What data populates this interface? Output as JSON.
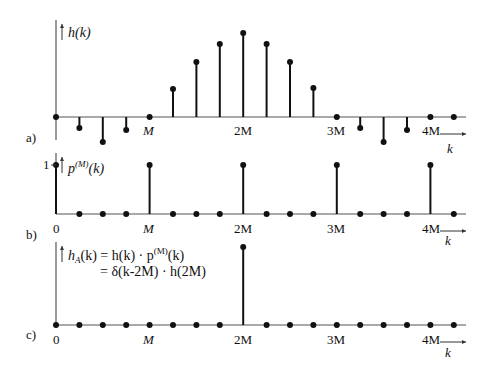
{
  "figure": {
    "panels": [
      {
        "id": "a",
        "tag": "a)",
        "ylabel": "h(k)",
        "axis_y": 117,
        "x_ticks": [
          {
            "label": "M",
            "x": 149
          },
          {
            "label": "2M",
            "x": 243
          },
          {
            "label": "3M",
            "x": 336
          },
          {
            "label": "4M",
            "x": 430
          }
        ],
        "xlabel": "k"
      },
      {
        "id": "b",
        "tag": "b)",
        "ylabel": "p(M)(k)",
        "ylabel_base": "p",
        "ylabel_sup": "(M)",
        "ylabel_arg": "(k)",
        "y_tick": "1",
        "axis_y": 214,
        "x_ticks": [
          {
            "label": "0",
            "x": 56
          },
          {
            "label": "M",
            "x": 149
          },
          {
            "label": "2M",
            "x": 243
          },
          {
            "label": "3M",
            "x": 336
          },
          {
            "label": "4M",
            "x": 430
          }
        ],
        "xlabel": "k"
      },
      {
        "id": "c",
        "tag": "c)",
        "formula_line1_lhs": "h",
        "formula_line1_sub": "A",
        "formula_line1_rest": "(k) = h(k) · p",
        "formula_line1_sup": "(M)",
        "formula_line1_end": "(k)",
        "formula_line2": "= δ(k-2M) · h(2M)",
        "axis_y": 325,
        "x_ticks": [
          {
            "label": "0",
            "x": 56
          },
          {
            "label": "M",
            "x": 149
          },
          {
            "label": "2M",
            "x": 243
          },
          {
            "label": "3M",
            "x": 336
          },
          {
            "label": "4M",
            "x": 430
          }
        ],
        "xlabel": "k"
      }
    ]
  },
  "chart_data": [
    {
      "type": "stem",
      "title": "a) h(k)",
      "xlabel": "k",
      "ylabel": "h(k)",
      "x_tick_labels": [
        "M",
        "2M",
        "3M",
        "4M"
      ],
      "note": "M = 4 samples per period; values in relative units (peak = 1 at k=2M)",
      "x": [
        0,
        1,
        2,
        3,
        4,
        5,
        6,
        7,
        8,
        9,
        10,
        11,
        12,
        13,
        14,
        15,
        16,
        17
      ],
      "values": [
        0,
        -0.13,
        -0.3,
        -0.15,
        0,
        0.33,
        0.66,
        0.88,
        1.0,
        0.88,
        0.66,
        0.34,
        0,
        -0.13,
        -0.3,
        -0.15,
        0,
        0
      ]
    },
    {
      "type": "stem",
      "title": "b) p(M)(k)",
      "xlabel": "k",
      "ylabel": "p(M)(k)",
      "x_tick_labels": [
        "0",
        "M",
        "2M",
        "3M",
        "4M"
      ],
      "y_tick_labels": [
        "1"
      ],
      "x": [
        0,
        1,
        2,
        3,
        4,
        5,
        6,
        7,
        8,
        9,
        10,
        11,
        12,
        13,
        14,
        15,
        16,
        17
      ],
      "values": [
        1,
        0,
        0,
        0,
        1,
        0,
        0,
        0,
        1,
        0,
        0,
        0,
        1,
        0,
        0,
        0,
        1,
        0
      ]
    },
    {
      "type": "stem",
      "title": "c) hA(k) = h(k)·p(M)(k) = δ(k-2M)·h(2M)",
      "xlabel": "k",
      "ylabel": "hA(k)",
      "x_tick_labels": [
        "0",
        "M",
        "2M",
        "3M",
        "4M"
      ],
      "x": [
        0,
        1,
        2,
        3,
        4,
        5,
        6,
        7,
        8,
        9,
        10,
        11,
        12,
        13,
        14,
        15,
        16,
        17
      ],
      "values": [
        0,
        0,
        0,
        0,
        0,
        0,
        0,
        0,
        1,
        0,
        0,
        0,
        0,
        0,
        0,
        0,
        0,
        0
      ]
    }
  ],
  "geometry": {
    "x0": 56,
    "dx": 23.4,
    "axis_end": 466,
    "panels": [
      {
        "axis_y": 117,
        "top_y": 20,
        "bottom_y": 140,
        "stem_tops": [
          117,
          128,
          142,
          130,
          117,
          89,
          62,
          44,
          33,
          44,
          62,
          88,
          117,
          128,
          142,
          130,
          117,
          117
        ]
      },
      {
        "axis_y": 214,
        "top_y": 153,
        "bottom_y": 214,
        "stem_tops": [
          165,
          214,
          214,
          214,
          165,
          214,
          214,
          214,
          165,
          214,
          214,
          214,
          165,
          214,
          214,
          214,
          165,
          214
        ]
      },
      {
        "axis_y": 325,
        "top_y": 242,
        "bottom_y": 325,
        "stem_tops": [
          325,
          325,
          325,
          325,
          325,
          325,
          325,
          325,
          247,
          325,
          325,
          325,
          325,
          325,
          325,
          325,
          325,
          325
        ]
      }
    ]
  }
}
